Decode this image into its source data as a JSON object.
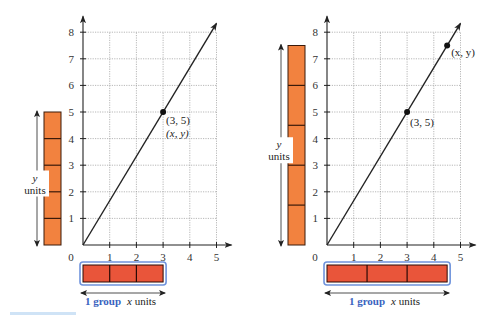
{
  "colors": {
    "vertical_bar": "#f2823f",
    "horizontal_bar": "#e9553a",
    "horizontal_bar_outline": "#6f93dc",
    "group_text": "#3a63c0",
    "axis": "#222222",
    "grid": "#9a9a9a"
  },
  "chart_data": [
    {
      "type": "line",
      "title": "",
      "xlabel": "",
      "ylabel": "",
      "xlim": [
        0,
        5
      ],
      "ylim": [
        0,
        8
      ],
      "grid": true,
      "x_ticks": [
        "1",
        "2",
        "3",
        "4",
        "5"
      ],
      "y_ticks": [
        "1",
        "2",
        "3",
        "4",
        "5",
        "6",
        "7",
        "8"
      ],
      "origin_label": "0",
      "series": [
        {
          "name": "y = (5/3)x",
          "x": [
            0,
            5
          ],
          "y": [
            0,
            8.33
          ]
        }
      ],
      "points": [
        {
          "x": 3,
          "y": 5,
          "label": "(3, 5)",
          "label2": "(x, y)"
        }
      ],
      "tape_diagram": {
        "vertical": {
          "total": 5,
          "parts": 5,
          "label_var": "y",
          "label_unit": "units"
        },
        "horizontal": {
          "total": 3,
          "parts": 3,
          "label_group": "1 group",
          "label_var": "x",
          "label_unit": "units"
        }
      }
    },
    {
      "type": "line",
      "title": "",
      "xlabel": "",
      "ylabel": "",
      "xlim": [
        0,
        5
      ],
      "ylim": [
        0,
        8
      ],
      "grid": true,
      "x_ticks": [
        "1",
        "2",
        "3",
        "4",
        "5"
      ],
      "y_ticks": [
        "1",
        "2",
        "3",
        "4",
        "5",
        "6",
        "7",
        "8"
      ],
      "origin_label": "0",
      "series": [
        {
          "name": "y = (5/3)x",
          "x": [
            0,
            5
          ],
          "y": [
            0,
            8.33
          ]
        }
      ],
      "points": [
        {
          "x": 3,
          "y": 5,
          "label": "(3, 5)"
        },
        {
          "x": 4.5,
          "y": 7.5,
          "label": "(x, y)"
        }
      ],
      "tape_diagram": {
        "vertical": {
          "total": 7.5,
          "parts": 5,
          "label_var": "y",
          "label_unit": "units"
        },
        "horizontal": {
          "total": 4.5,
          "parts": 3,
          "label_group": "1 group",
          "label_var": "x",
          "label_unit": "units"
        }
      }
    }
  ]
}
